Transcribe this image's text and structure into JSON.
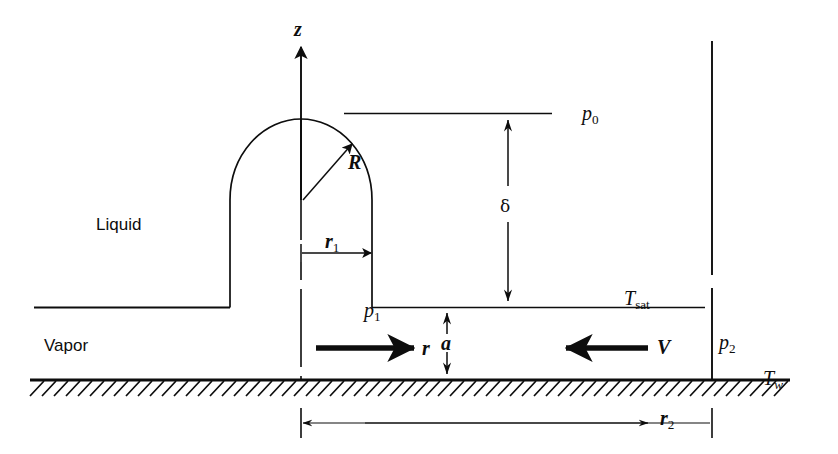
{
  "figure": {
    "kind": "engineering-schematic",
    "width": 838,
    "height": 454,
    "background_color": "#ffffff",
    "line_color": "#0d0d0d"
  },
  "labels": {
    "axis_z": "z",
    "radius_R": "R",
    "radius_r1_base": "r",
    "radius_r1_sub": "1",
    "radius_r2_base": "r",
    "radius_r2_sub": "2",
    "radial_coord": "r",
    "velocity_V": "V",
    "gap_a": "a",
    "thickness_delta": "δ",
    "pressure_p0_base": "p",
    "pressure_p0_sub": "0",
    "pressure_p1_base": "p",
    "pressure_p1_sub": "1",
    "pressure_p2_base": "p",
    "pressure_p2_sub": "2",
    "temp_sat_base": "T",
    "temp_sat_sub": "sat",
    "temp_wall_base": "T",
    "temp_wall_sub": "w",
    "region_liquid": "Liquid",
    "region_vapor": "Vapor"
  },
  "geometry": {
    "centerline_x": 301,
    "wall_y": 380,
    "interface_y": 307,
    "p0_line_y": 113,
    "dome_apex_y": 119,
    "dome_left_x": 230,
    "dome_right_x": 372,
    "dome_center_y": 200,
    "right_boundary_x": 712,
    "r2_dim_y": 423,
    "r1_dim_y": 253,
    "delta_dim_x": 508,
    "a_dim_x": 447
  }
}
